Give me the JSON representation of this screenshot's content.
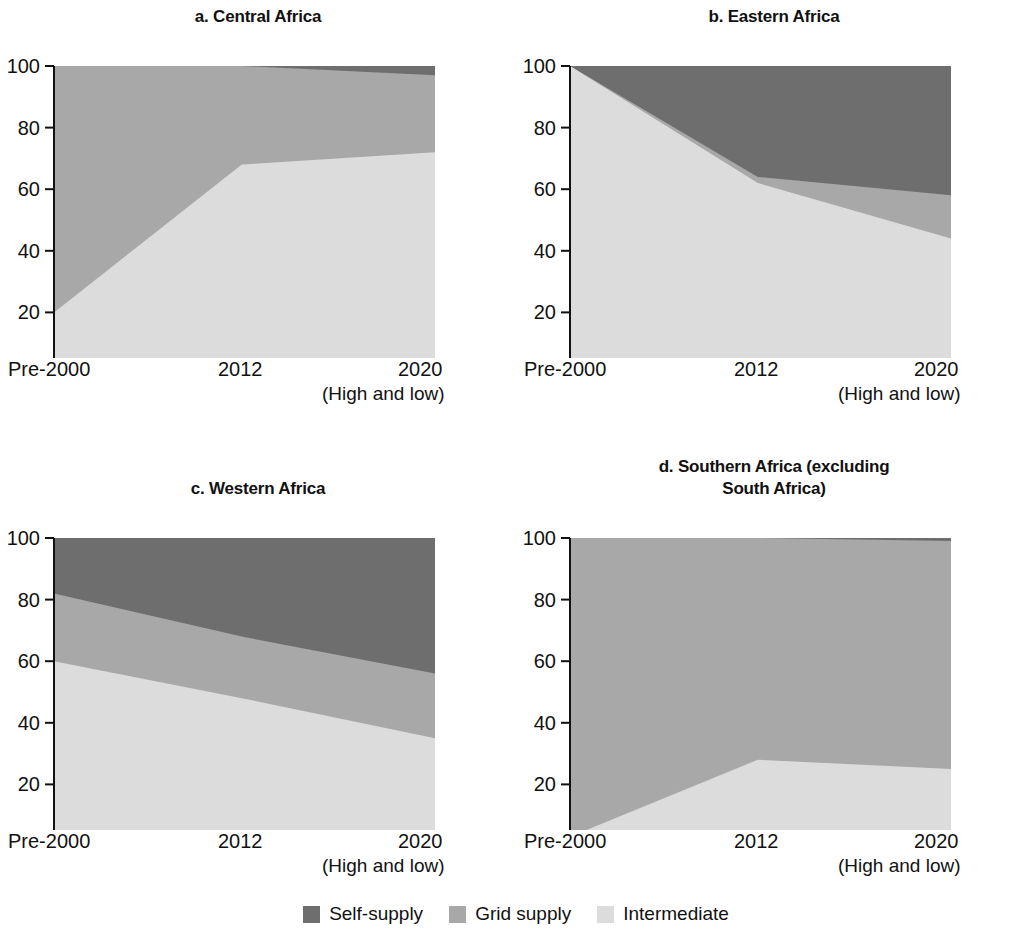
{
  "legend": {
    "items": [
      {
        "label": "Self-supply",
        "color": "#6e6e6e",
        "key": "self_supply"
      },
      {
        "label": "Grid supply",
        "color": "#a8a8a8",
        "key": "grid_supply"
      },
      {
        "label": "Intermediate",
        "color": "#dcdcdc",
        "key": "intermediate"
      }
    ]
  },
  "axis": {
    "y_ticks": [
      "0",
      "20",
      "40",
      "60",
      "80",
      "100"
    ],
    "y_values": [
      0,
      20,
      40,
      60,
      80,
      100
    ],
    "x_ticks": [
      "Pre-2000",
      "2012",
      "2020"
    ],
    "x_sublabel": "(High and low)",
    "ylim": [
      0,
      100
    ]
  },
  "chart_data": [
    {
      "type": "area",
      "panel": "a",
      "title": "a. Central Africa",
      "categories": [
        "Pre-2000",
        "2012",
        "2020"
      ],
      "xlabel": "(High and low)",
      "ylabel": "",
      "ylim": [
        0,
        100
      ],
      "grid": false,
      "stacked": true,
      "legend_position": "bottom-center-shared",
      "series": [
        {
          "name": "Intermediate",
          "color": "#dcdcdc",
          "values": [
            20,
            68,
            72
          ]
        },
        {
          "name": "Grid supply",
          "color": "#a8a8a8",
          "values": [
            80,
            32,
            25
          ]
        },
        {
          "name": "Self-supply",
          "color": "#6e6e6e",
          "values": [
            0,
            0,
            3
          ]
        }
      ],
      "cumulative_tops": {
        "intermediate": [
          20,
          68,
          72
        ],
        "grid_supply": [
          100,
          100,
          97
        ],
        "self_supply": [
          100,
          100,
          100
        ]
      }
    },
    {
      "type": "area",
      "panel": "b",
      "title": "b. Eastern Africa",
      "categories": [
        "Pre-2000",
        "2012",
        "2020"
      ],
      "xlabel": "(High and low)",
      "ylabel": "",
      "ylim": [
        0,
        100
      ],
      "grid": false,
      "stacked": true,
      "legend_position": "bottom-center-shared",
      "series": [
        {
          "name": "Intermediate",
          "color": "#dcdcdc",
          "values": [
            100,
            62,
            44
          ]
        },
        {
          "name": "Grid supply",
          "color": "#a8a8a8",
          "values": [
            0,
            2,
            14
          ]
        },
        {
          "name": "Self-supply",
          "color": "#6e6e6e",
          "values": [
            0,
            36,
            42
          ]
        }
      ],
      "cumulative_tops": {
        "intermediate": [
          100,
          62,
          44
        ],
        "grid_supply": [
          100,
          64,
          58
        ],
        "self_supply": [
          100,
          100,
          100
        ]
      }
    },
    {
      "type": "area",
      "panel": "c",
      "title": "c. Western Africa",
      "categories": [
        "Pre-2000",
        "2012",
        "2020"
      ],
      "xlabel": "(High and low)",
      "ylabel": "",
      "ylim": [
        0,
        100
      ],
      "grid": false,
      "stacked": true,
      "legend_position": "bottom-center-shared",
      "series": [
        {
          "name": "Intermediate",
          "color": "#dcdcdc",
          "values": [
            60,
            48,
            35
          ]
        },
        {
          "name": "Grid supply",
          "color": "#a8a8a8",
          "values": [
            22,
            20,
            21
          ]
        },
        {
          "name": "Self-supply",
          "color": "#6e6e6e",
          "values": [
            18,
            32,
            44
          ]
        }
      ],
      "cumulative_tops": {
        "intermediate": [
          60,
          48,
          35
        ],
        "grid_supply": [
          82,
          68,
          56
        ],
        "self_supply": [
          100,
          100,
          100
        ]
      }
    },
    {
      "type": "area",
      "panel": "d",
      "title": "d. Southern Africa (excluding South Africa)",
      "title_lines": [
        "d. Southern Africa (excluding",
        "South Africa)"
      ],
      "categories": [
        "Pre-2000",
        "2012",
        "2020"
      ],
      "xlabel": "(High and low)",
      "ylabel": "",
      "ylim": [
        0,
        100
      ],
      "grid": false,
      "stacked": true,
      "legend_position": "bottom-center-shared",
      "series": [
        {
          "name": "Intermediate",
          "color": "#dcdcdc",
          "values": [
            3,
            28,
            25
          ]
        },
        {
          "name": "Grid supply",
          "color": "#a8a8a8",
          "values": [
            97,
            72,
            74
          ]
        },
        {
          "name": "Self-supply",
          "color": "#6e6e6e",
          "values": [
            0,
            0,
            1
          ]
        }
      ],
      "cumulative_tops": {
        "intermediate": [
          3,
          28,
          25
        ],
        "grid_supply": [
          100,
          100,
          99
        ],
        "self_supply": [
          100,
          100,
          100
        ]
      }
    }
  ]
}
